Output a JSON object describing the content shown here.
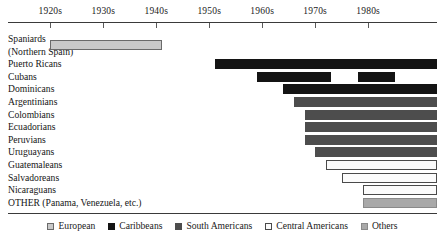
{
  "chart_data": {
    "type": "bar",
    "orientation": "horizontal",
    "title": "",
    "subtitle": "",
    "xlabel": "",
    "ylabel": "",
    "axis": {
      "position": "top",
      "grid": false,
      "tick_labels": [
        "1920s",
        "1930s",
        "1940s",
        "1950s",
        "1960s",
        "1970s",
        "1980s"
      ],
      "tick_values": [
        1920,
        1930,
        1940,
        1950,
        1960,
        1970,
        1980
      ],
      "xlim": [
        1912,
        1993
      ]
    },
    "legend": {
      "position": "bottom",
      "entries": [
        {
          "label": "European",
          "color": "#c9c9c9",
          "style": "light-gray-filled"
        },
        {
          "label": "Caribbeans",
          "color": "#141414",
          "style": "black-filled"
        },
        {
          "label": "South Americans",
          "color": "#4d4d4d",
          "style": "dark-gray-filled"
        },
        {
          "label": "Central Americans",
          "color": "#fbfbfb",
          "style": "white-outlined"
        },
        {
          "label": "Others",
          "color": "#a9a9a9",
          "style": "medium-gray-filled"
        }
      ]
    },
    "categories": [
      "Spaniards (Northern Spain)",
      "Puerto Ricans",
      "Cubans",
      "Dominicans",
      "Argentinians",
      "Colombians",
      "Ecuadorians",
      "Peruvians",
      "Uruguayans",
      "Guatemaleans",
      "Salvadoreans",
      "Nicaraguans",
      "OTHER (Panama, Venezuela, etc.)"
    ],
    "rows": [
      {
        "label_line1": "Spaniards",
        "label_line2": "(Northern Spain)",
        "group": "European",
        "color": "#c9c9c9",
        "style": "light-gray-filled",
        "spans": [
          {
            "start": 1920,
            "end": 1941
          }
        ]
      },
      {
        "label_line1": "Puerto Ricans",
        "label_line2": "",
        "group": "Caribbeans",
        "color": "#141414",
        "style": "black-filled",
        "spans": [
          {
            "start": 1951,
            "end": 1993
          }
        ]
      },
      {
        "label_line1": "Cubans",
        "label_line2": "",
        "group": "Caribbeans",
        "color": "#141414",
        "style": "black-filled",
        "spans": [
          {
            "start": 1959,
            "end": 1973
          },
          {
            "start": 1978,
            "end": 1985
          }
        ]
      },
      {
        "label_line1": "Dominicans",
        "label_line2": "",
        "group": "Caribbeans",
        "color": "#141414",
        "style": "black-filled",
        "spans": [
          {
            "start": 1964,
            "end": 1993
          }
        ]
      },
      {
        "label_line1": "Argentinians",
        "label_line2": "",
        "group": "South Americans",
        "color": "#4d4d4d",
        "style": "dark-gray-filled",
        "spans": [
          {
            "start": 1966,
            "end": 1993
          }
        ]
      },
      {
        "label_line1": "Colombians",
        "label_line2": "",
        "group": "South Americans",
        "color": "#4d4d4d",
        "style": "dark-gray-filled",
        "spans": [
          {
            "start": 1968,
            "end": 1993
          }
        ]
      },
      {
        "label_line1": "Ecuadorians",
        "label_line2": "",
        "group": "South Americans",
        "color": "#4d4d4d",
        "style": "dark-gray-filled",
        "spans": [
          {
            "start": 1968,
            "end": 1993
          }
        ]
      },
      {
        "label_line1": "Peruvians",
        "label_line2": "",
        "group": "South Americans",
        "color": "#4d4d4d",
        "style": "dark-gray-filled",
        "spans": [
          {
            "start": 1968,
            "end": 1993
          }
        ]
      },
      {
        "label_line1": "Uruguayans",
        "label_line2": "",
        "group": "South Americans",
        "color": "#4d4d4d",
        "style": "dark-gray-filled",
        "spans": [
          {
            "start": 1970,
            "end": 1993
          }
        ]
      },
      {
        "label_line1": "Guatemaleans",
        "label_line2": "",
        "group": "Central Americans",
        "color": "#fbfbfb",
        "style": "white-outlined",
        "spans": [
          {
            "start": 1972,
            "end": 1993
          }
        ]
      },
      {
        "label_line1": "Salvadoreans",
        "label_line2": "",
        "group": "Central Americans",
        "color": "#fbfbfb",
        "style": "white-outlined",
        "spans": [
          {
            "start": 1975,
            "end": 1993
          }
        ]
      },
      {
        "label_line1": "Nicaraguans",
        "label_line2": "",
        "group": "Central Americans",
        "color": "#fbfbfb",
        "style": "white-outlined",
        "spans": [
          {
            "start": 1979,
            "end": 1993
          }
        ]
      },
      {
        "label_line1": "OTHER (Panama, Venezuela, etc.)",
        "label_line2": "",
        "group": "Others",
        "color": "#a9a9a9",
        "style": "medium-gray-filled",
        "spans": [
          {
            "start": 1979,
            "end": 1993
          }
        ]
      }
    ]
  }
}
